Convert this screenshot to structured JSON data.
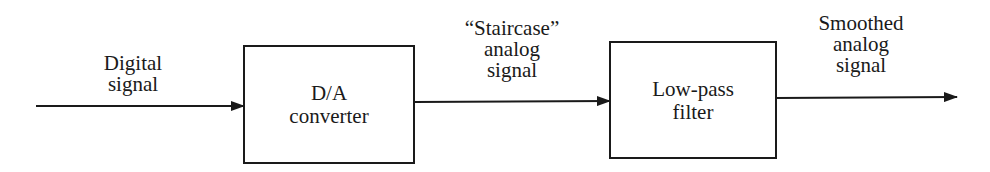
{
  "diagram": {
    "type": "block-diagram",
    "colors": {
      "stroke": "#1a1a1a",
      "background": "#ffffff"
    },
    "blocks": [
      {
        "id": "da",
        "lines": [
          "D/A",
          "converter"
        ]
      },
      {
        "id": "lpf",
        "lines": [
          "Low-pass",
          "filter"
        ]
      }
    ],
    "signals": [
      {
        "id": "input",
        "lines": [
          "Digital",
          "signal"
        ]
      },
      {
        "id": "intermediate",
        "lines": [
          "“Staircase”",
          "analog",
          "signal"
        ]
      },
      {
        "id": "output",
        "lines": [
          "Smoothed",
          "analog",
          "signal"
        ]
      }
    ],
    "connections": [
      {
        "from": "input",
        "to": "da"
      },
      {
        "from": "da",
        "to": "lpf"
      },
      {
        "from": "lpf",
        "to": "output"
      }
    ]
  }
}
